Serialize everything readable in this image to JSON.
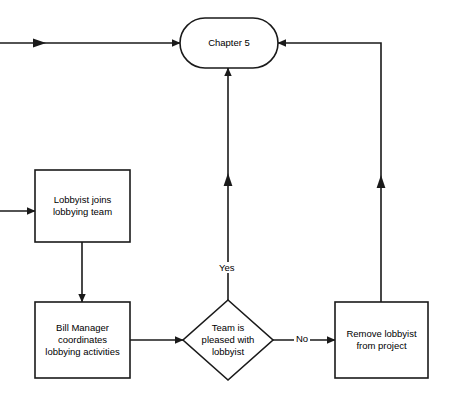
{
  "diagram": {
    "type": "flowchart",
    "title_node": "Chapter 5",
    "stroke_color": "#1a1a1a",
    "fill_color": "#ffffff",
    "text_color": "#000000",
    "nodes": [
      {
        "id": "chapter5",
        "shape": "rounded-rectangle",
        "label": "Chapter 5",
        "x": 180,
        "y": 18,
        "w": 98,
        "h": 50
      },
      {
        "id": "lobbyist-joins",
        "shape": "rectangle",
        "label": "Lobbyist joins\nlobbying team",
        "x": 35,
        "y": 170,
        "w": 95,
        "h": 72
      },
      {
        "id": "bill-manager",
        "shape": "rectangle",
        "label": "Bill Manager\ncoordinates\nlobbying activities",
        "x": 35,
        "y": 302,
        "w": 95,
        "h": 76
      },
      {
        "id": "team-pleased",
        "shape": "diamond",
        "label": "Team is\npleased with\nlobbyist",
        "x": 183,
        "y": 300,
        "w": 90,
        "h": 80
      },
      {
        "id": "remove-lobbyist",
        "shape": "rectangle",
        "label": "Remove lobbyist\nfrom project",
        "x": 335,
        "y": 302,
        "w": 93,
        "h": 76
      }
    ],
    "edges": [
      {
        "id": "external-to-chapter5",
        "label": "",
        "from": "external-left",
        "to": "chapter5"
      },
      {
        "id": "external-to-lobbyist",
        "label": "",
        "from": "external-left",
        "to": "lobbyist-joins"
      },
      {
        "id": "lobbyist-to-billmanager",
        "label": "",
        "from": "lobbyist-joins",
        "to": "bill-manager"
      },
      {
        "id": "billmanager-to-decision",
        "label": "",
        "from": "bill-manager",
        "to": "team-pleased"
      },
      {
        "id": "decision-yes-to-chapter5",
        "label": "Yes",
        "from": "team-pleased",
        "to": "chapter5"
      },
      {
        "id": "decision-no-to-remove",
        "label": "No",
        "from": "team-pleased",
        "to": "remove-lobbyist"
      },
      {
        "id": "remove-to-chapter5",
        "label": "",
        "from": "remove-lobbyist",
        "to": "chapter5"
      }
    ],
    "edge_labels": {
      "yes": "Yes",
      "no": "No"
    }
  }
}
